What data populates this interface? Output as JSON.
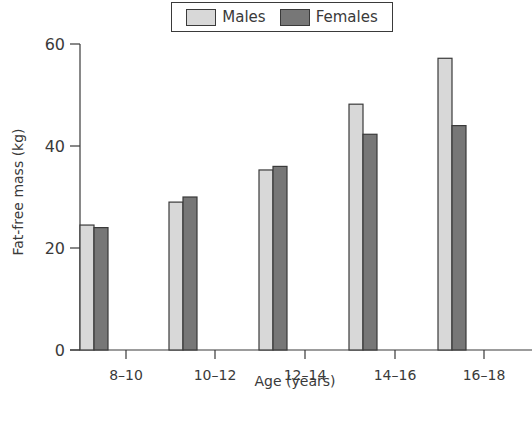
{
  "chart_data": {
    "type": "bar",
    "title": "",
    "xlabel": "Age (years)",
    "ylabel": "Fat-free mass  (kg)",
    "categories": [
      "8–10",
      "10–12",
      "12–14",
      "14–16",
      "16–18"
    ],
    "series": [
      {
        "name": "Males",
        "color": "#d8d8d8",
        "values": [
          24.5,
          29,
          35.3,
          48.2,
          57.2
        ]
      },
      {
        "name": "Females",
        "color": "#777777",
        "values": [
          24,
          30,
          36,
          42.3,
          44
        ]
      }
    ],
    "yticks": [
      0,
      20,
      40,
      60
    ],
    "ylim": [
      0,
      60
    ],
    "grid": false,
    "legend_position": "top-center"
  },
  "legend": {
    "males": "Males",
    "females": "Females"
  },
  "axes": {
    "xlabel": "Age (years)",
    "ylabel": "Fat-free mass  (kg)"
  },
  "colors": {
    "males_fill": "#d8d8d8",
    "females_fill": "#777777",
    "stroke": "#3a3a3a"
  }
}
